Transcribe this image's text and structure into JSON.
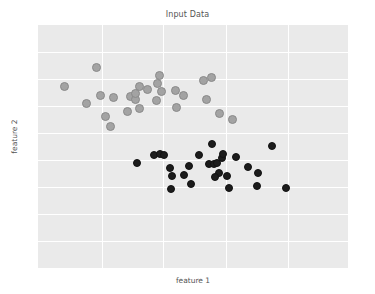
{
  "chart_data": {
    "type": "scatter",
    "title": "Input Data",
    "xlabel": "feature 1",
    "ylabel": "feature 2",
    "grid": true,
    "legend": "none",
    "xlim": [
      0,
      1
    ],
    "ylim": [
      0,
      1
    ],
    "axis_ticks": {
      "x": [],
      "y": []
    },
    "gridlines": {
      "x_frac": [
        0.206,
        0.403,
        0.606,
        0.806
      ],
      "y_frac": [
        0.111,
        0.222,
        0.333,
        0.445,
        0.556,
        0.667,
        0.778,
        0.889
      ]
    },
    "series": [
      {
        "name": "class 0",
        "color": "#a3a3a3",
        "edgecolor": "#8a8a8a",
        "marker": "circle",
        "points": [
          {
            "x": 0.19,
            "y": 0.827
          },
          {
            "x": 0.087,
            "y": 0.748
          },
          {
            "x": 0.203,
            "y": 0.708
          },
          {
            "x": 0.155,
            "y": 0.676
          },
          {
            "x": 0.242,
            "y": 0.7
          },
          {
            "x": 0.329,
            "y": 0.746
          },
          {
            "x": 0.393,
            "y": 0.793
          },
          {
            "x": 0.298,
            "y": 0.705
          },
          {
            "x": 0.313,
            "y": 0.694
          },
          {
            "x": 0.316,
            "y": 0.718
          },
          {
            "x": 0.352,
            "y": 0.736
          },
          {
            "x": 0.397,
            "y": 0.727
          },
          {
            "x": 0.442,
            "y": 0.73
          },
          {
            "x": 0.468,
            "y": 0.71
          },
          {
            "x": 0.383,
            "y": 0.688
          },
          {
            "x": 0.326,
            "y": 0.655
          },
          {
            "x": 0.448,
            "y": 0.66
          },
          {
            "x": 0.535,
            "y": 0.77
          },
          {
            "x": 0.561,
            "y": 0.783
          },
          {
            "x": 0.545,
            "y": 0.694
          },
          {
            "x": 0.587,
            "y": 0.635
          },
          {
            "x": 0.626,
            "y": 0.612
          },
          {
            "x": 0.29,
            "y": 0.646
          },
          {
            "x": 0.219,
            "y": 0.622
          },
          {
            "x": 0.233,
            "y": 0.583
          },
          {
            "x": 0.384,
            "y": 0.76
          }
        ]
      },
      {
        "name": "class 1",
        "color": "#1c1c1c",
        "edgecolor": "#111111",
        "marker": "circle",
        "points": [
          {
            "x": 0.318,
            "y": 0.431
          },
          {
            "x": 0.374,
            "y": 0.465
          },
          {
            "x": 0.394,
            "y": 0.468
          },
          {
            "x": 0.405,
            "y": 0.464
          },
          {
            "x": 0.425,
            "y": 0.41
          },
          {
            "x": 0.432,
            "y": 0.38
          },
          {
            "x": 0.43,
            "y": 0.325
          },
          {
            "x": 0.47,
            "y": 0.383
          },
          {
            "x": 0.488,
            "y": 0.418
          },
          {
            "x": 0.518,
            "y": 0.467
          },
          {
            "x": 0.56,
            "y": 0.51
          },
          {
            "x": 0.552,
            "y": 0.43
          },
          {
            "x": 0.568,
            "y": 0.43
          },
          {
            "x": 0.578,
            "y": 0.433
          },
          {
            "x": 0.594,
            "y": 0.454
          },
          {
            "x": 0.597,
            "y": 0.468
          },
          {
            "x": 0.583,
            "y": 0.392
          },
          {
            "x": 0.57,
            "y": 0.375
          },
          {
            "x": 0.61,
            "y": 0.379
          },
          {
            "x": 0.64,
            "y": 0.455
          },
          {
            "x": 0.615,
            "y": 0.33
          },
          {
            "x": 0.678,
            "y": 0.415
          },
          {
            "x": 0.71,
            "y": 0.39
          },
          {
            "x": 0.705,
            "y": 0.337
          },
          {
            "x": 0.755,
            "y": 0.502
          },
          {
            "x": 0.8,
            "y": 0.328
          },
          {
            "x": 0.492,
            "y": 0.344
          }
        ]
      }
    ]
  }
}
